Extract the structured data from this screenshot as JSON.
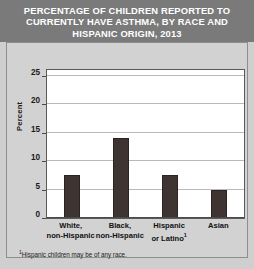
{
  "title": "PERCENTAGE OF CHILDREN REPORTED TO CURRENTLY HAVE ASTHMA, BY RACE AND HISPANIC ORIGIN, 2013",
  "footnote": {
    "marker": "1",
    "text": "Hispanic children may be of any race."
  },
  "colors": {
    "bar": "#3e3533",
    "title_band": "#7a7a7a",
    "panel": "#d2d2d2",
    "plot_background": "#ffffff",
    "gridline": "#b9b9b9",
    "title_text": "#ffffff"
  },
  "chart_data": {
    "type": "bar",
    "title": "PERCENTAGE OF CHILDREN REPORTED TO CURRENTLY HAVE ASTHMA, BY RACE AND HISPANIC ORIGIN, 2013",
    "categories": [
      "White, non-Hispanic",
      "Black, non-Hispanic",
      "Hispanic or Latino",
      "Asian"
    ],
    "category_lines": [
      [
        "White,",
        "non-Hispanic"
      ],
      [
        "Black,",
        "non-Hispanic"
      ],
      [
        "Hispanic",
        "or Latino"
      ],
      [
        "Asian",
        ""
      ]
    ],
    "category_footnote_marks": [
      "",
      "",
      "1",
      ""
    ],
    "values": [
      7.6,
      14.0,
      7.6,
      5.0
    ],
    "xlabel": "",
    "ylabel": "Percent",
    "ylim": [
      0,
      26
    ],
    "yticks": [
      0,
      5,
      10,
      15,
      20,
      25
    ],
    "ytick_labels": [
      "0",
      "5",
      "10",
      "15",
      "20",
      "25"
    ],
    "grid": true,
    "legend": "none"
  }
}
